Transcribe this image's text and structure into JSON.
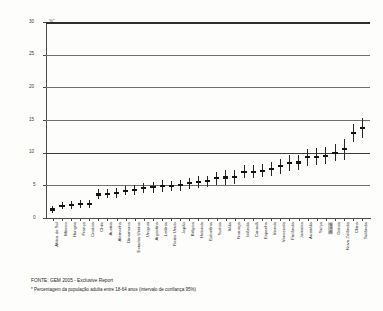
{
  "chart_data": {
    "type": "scatter",
    "title": "",
    "subtitle": "",
    "xlabel": "",
    "ylabel": "%*",
    "unit_label": "%*",
    "ylim": [
      0,
      30
    ],
    "yticks": [
      0,
      5,
      10,
      15,
      20,
      25,
      30
    ],
    "ytick_labels": [
      "0",
      "5",
      "10",
      "15",
      "20",
      "25",
      "30"
    ],
    "grid": true,
    "legend_position": "none",
    "error_bars": "95% confidence interval",
    "highlighted_category": "Brasil",
    "highlight_color": "#c9c9c9",
    "marker_color": "#131313",
    "categories": [
      "África do Sul",
      "México",
      "Hungria",
      "França",
      "Croácia",
      "Chile",
      "Áustria",
      "Alemanha",
      "Dinamarca",
      "Estados Unidos",
      "Uruguai",
      "Argentina",
      "Letônia",
      "Reino Unido",
      "Japão",
      "Bélgica",
      "Holanda",
      "Eslovênia",
      "Suécia",
      "Itália",
      "Noruega",
      "Islândia",
      "Canadá",
      "Espanha",
      "Irlanda",
      "Venezuela",
      "Finlândia",
      "Jamaica",
      "Austrália",
      "Suíça",
      "Brasil",
      "Grécia",
      "Nova Zelândia",
      "China",
      "Tailândia"
    ],
    "values": [
      1.3,
      1.9,
      2.0,
      2.1,
      2.2,
      3.6,
      3.7,
      3.8,
      4.2,
      4.3,
      4.6,
      4.7,
      4.9,
      4.9,
      5.0,
      5.3,
      5.5,
      5.6,
      6.1,
      6.2,
      6.3,
      7.1,
      7.1,
      7.2,
      7.5,
      7.9,
      8.4,
      8.5,
      9.3,
      9.4,
      9.5,
      10.0,
      10.5,
      13.0,
      13.8
    ],
    "ci_low": [
      0.7,
      1.3,
      1.4,
      1.5,
      1.6,
      2.9,
      3.0,
      3.1,
      3.5,
      3.5,
      3.8,
      3.9,
      4.0,
      4.1,
      4.2,
      4.5,
      4.6,
      4.7,
      5.1,
      5.1,
      5.2,
      6.1,
      6.1,
      6.2,
      6.4,
      6.8,
      7.2,
      7.3,
      8.0,
      8.1,
      8.2,
      8.7,
      8.9,
      11.6,
      12.3
    ],
    "ci_high": [
      1.9,
      2.5,
      2.6,
      2.7,
      2.8,
      4.4,
      4.5,
      4.6,
      4.9,
      5.1,
      5.4,
      5.5,
      5.8,
      5.7,
      5.8,
      6.1,
      6.4,
      6.5,
      7.1,
      7.3,
      7.4,
      8.1,
      8.1,
      8.2,
      8.6,
      9.0,
      9.6,
      9.7,
      10.6,
      10.7,
      10.8,
      11.3,
      12.1,
      14.4,
      15.3
    ]
  },
  "footnotes": {
    "source": "FONTE: GEM 2005 - Exclusive Report",
    "note": "* Percentagem da população adulta entre 18-64 anos (intervalo de confiança 95%)"
  }
}
